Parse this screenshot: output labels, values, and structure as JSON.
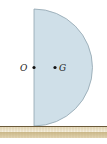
{
  "diagram": {
    "points": [
      {
        "label": "O",
        "role": "center of flat edge"
      },
      {
        "label": "G",
        "role": "center of mass"
      }
    ],
    "colors": {
      "disk_fill": "#cfdfe8",
      "disk_edge": "#8fa3ae",
      "ground_fill": "#d9c9a0",
      "ground_line": "#6b5a3a",
      "point": "#111111"
    }
  }
}
